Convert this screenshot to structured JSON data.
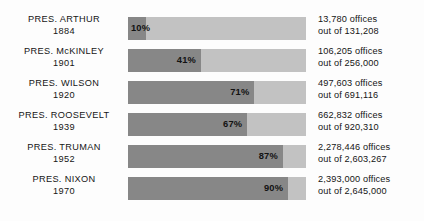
{
  "chart_data": {
    "type": "bar",
    "orientation": "horizontal",
    "title": "",
    "subtitle": "",
    "xlabel": "",
    "ylabel": "",
    "xlim": [
      0,
      100
    ],
    "grid": false,
    "legend": null,
    "value_suffix": "%",
    "categories": [
      "PRES. ARTHUR 1884",
      "PRES. McKINLEY 1901",
      "PRES. WILSON 1920",
      "PRES. ROOSEVELT 1939",
      "PRES. TRUMAN 1952",
      "PRES. NIXON 1970"
    ],
    "values": [
      10,
      41,
      71,
      67,
      87,
      90
    ],
    "series": [
      {
        "name": "Percent of offices under merit system",
        "values": [
          10,
          41,
          71,
          67,
          87,
          90
        ]
      }
    ],
    "colors": {
      "filled": "#878787",
      "remainder": "#c2c2c2",
      "background": "#fdfdfd",
      "text": "#151515"
    },
    "annotations": [
      "13,780 offices out of 131,208",
      "106,205 offices out of 256,000",
      "497,603 offices out of 691,116",
      "662,832 offices out of 920,310",
      "2,278,446 offices out of 2,603,267",
      "2,393,000 offices out of 2,645,000"
    ]
  },
  "rows": [
    {
      "president": "PRES.  ARTHUR",
      "year": "1884",
      "percent_label": "10%",
      "percent": 10,
      "offices_line1": "13,780 offices",
      "offices_line2": "out of 131,208"
    },
    {
      "president": "PRES.  McKINLEY",
      "year": "1901",
      "percent_label": "41%",
      "percent": 41,
      "offices_line1": "106,205 offices",
      "offices_line2": "out of 256,000"
    },
    {
      "president": "PRES.  WILSON",
      "year": "1920",
      "percent_label": "71%",
      "percent": 71,
      "offices_line1": "497,603 offices",
      "offices_line2": "out of 691,116"
    },
    {
      "president": "PRES.  ROOSEVELT",
      "year": "1939",
      "percent_label": "67%",
      "percent": 67,
      "offices_line1": "662,832 offices",
      "offices_line2": "out of 920,310"
    },
    {
      "president": "PRES.  TRUMAN",
      "year": "1952",
      "percent_label": "87%",
      "percent": 87,
      "offices_line1": "2,278,446 offices",
      "offices_line2": "out of 2,603,267"
    },
    {
      "president": "PRES. NIXON",
      "year": "1970",
      "percent_label": "90%",
      "percent": 90,
      "offices_line1": "2,393,000 offices",
      "offices_line2": "out of 2,645,000"
    }
  ]
}
